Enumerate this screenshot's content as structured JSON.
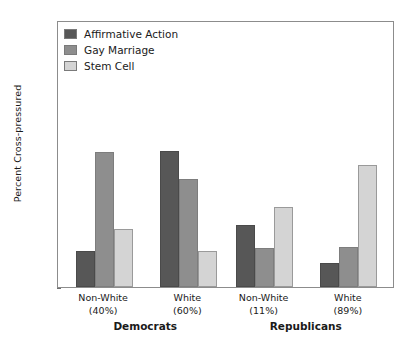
{
  "chart_data": {
    "type": "bar",
    "title": "",
    "xlabel": "",
    "ylabel": "Percent Cross-pressured",
    "ylim": [
      0,
      90
    ],
    "ytick_labels": [
      "90%",
      "80",
      "70",
      "60",
      "50",
      "40",
      "30",
      "20",
      "10",
      "0"
    ],
    "ytick_values": [
      90,
      80,
      70,
      60,
      50,
      40,
      30,
      20,
      10,
      0
    ],
    "grid": false,
    "legend_position": "upper left",
    "categories": [
      "Non-White",
      "White",
      "Non-White",
      "White"
    ],
    "category_sublabels": [
      "(40%)",
      "(60%)",
      "(11%)",
      "(89%)"
    ],
    "groups": [
      {
        "label": "Democrats",
        "categories": [
          0,
          1
        ]
      },
      {
        "label": "Republicans",
        "categories": [
          2,
          3
        ]
      }
    ],
    "series": [
      {
        "name": "Affirmative Action",
        "color": "#575757",
        "values": [
          12,
          46,
          21,
          8
        ]
      },
      {
        "name": "Gay Marriage",
        "color": "#8e8e8e",
        "values": [
          45.5,
          36.5,
          13,
          13.5
        ]
      },
      {
        "name": "Stem Cell",
        "color": "#d4d4d4",
        "values": [
          19.5,
          12,
          27,
          41
        ]
      }
    ]
  }
}
